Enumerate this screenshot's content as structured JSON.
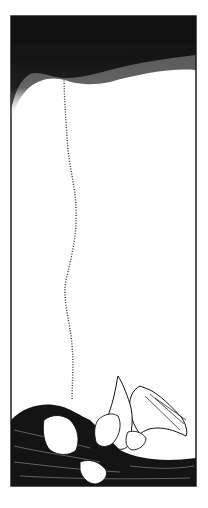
{
  "image": {
    "kind": "pen-and-ink illustration",
    "subject": "woman with long flowing dark hair lying down, holding a white dove with raised wing; a dotted smoke trail rises to a dark stippled sky",
    "colors": {
      "ink": "#111111",
      "paper": "#ffffff"
    },
    "frame": {
      "x": 11,
      "y": 16,
      "width": 185,
      "height": 470
    }
  }
}
